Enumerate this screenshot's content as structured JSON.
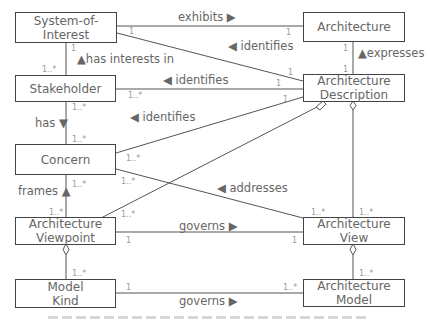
{
  "diagram": {
    "type": "UML class diagram (ISO/IEC/IEEE 42010 conceptual model)",
    "classes": {
      "system_of_interest": "System-of-\nInterest",
      "architecture": "Architecture",
      "stakeholder": "Stakeholder",
      "architecture_description": "Architecture\nDescription",
      "concern": "Concern",
      "architecture_viewpoint": "Architecture\nViewpoint",
      "architecture_view": "Architecture\nView",
      "model_kind": "Model\nKind",
      "architecture_model": "Architecture\nModel"
    },
    "associations": {
      "exhibits": "exhibits ▶",
      "identifies_soi": "◀ identifies",
      "has_interests_in": "▲has interests in",
      "expresses": "▲expresses",
      "identifies_stakeholder": "◀ identifies",
      "has": "has ▼",
      "identifies_concern": "◀ identifies",
      "frames": "frames ▲",
      "addresses": "◀ addresses",
      "governs_view": "governs ▶",
      "governs_model": "governs ▶"
    },
    "multiplicities": {
      "soi_exhibits": "1",
      "arch_exhibits": "1",
      "soi_identifies": "1",
      "ad_soi": "1",
      "soi_stake": "1",
      "stake_soi": "1..*",
      "arch_expr": "1",
      "ad_expr": "1",
      "stake_ad": "1..*",
      "ad_stake": "1",
      "ad_concern": "1",
      "stake_has": "1..*",
      "concern_has": "1..*",
      "concern_ad": "1..*",
      "concern_addr": "1..*",
      "concern_frames": "1..*",
      "vp_frames": "1..*",
      "vp_ad": "1..*",
      "view_addr": "1..*",
      "view_ad": "1..*",
      "vp_governs": "1",
      "view_governs": "1",
      "mk_vp": "1..*",
      "mk_governs": "1",
      "am_governs": "1..*",
      "am_view": "1..*"
    }
  }
}
